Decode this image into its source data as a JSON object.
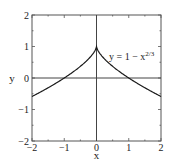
{
  "chart_data": {
    "type": "line",
    "title": "",
    "xlabel": "x",
    "ylabel": "y",
    "xlim": [
      -2,
      2
    ],
    "ylim": [
      -2,
      2
    ],
    "xticks": [
      -2,
      -1,
      0,
      1,
      2
    ],
    "yticks": [
      -2,
      -1,
      0,
      1,
      2
    ],
    "xtick_labels": [
      "−2",
      "−1",
      "0",
      "1",
      "2"
    ],
    "ytick_labels": [
      "−2",
      "−1",
      "0",
      "1",
      "2"
    ],
    "minor_tick_step": 0.5,
    "grid": false,
    "reference_lines": {
      "x": 0,
      "y": 0
    },
    "series": [
      {
        "name": "y = 1 − x^(2/3)",
        "function": "y = 1 - |x|^(2/3)",
        "x": [
          -2,
          -1.75,
          -1.5,
          -1.25,
          -1,
          -0.75,
          -0.5,
          -0.25,
          -0.1,
          0,
          0.1,
          0.25,
          0.5,
          0.75,
          1,
          1.25,
          1.5,
          1.75,
          2
        ],
        "values": [
          -0.587,
          -0.452,
          -0.31,
          -0.16,
          0.0,
          0.175,
          0.37,
          0.603,
          0.785,
          1.0,
          0.785,
          0.603,
          0.37,
          0.175,
          0.0,
          -0.16,
          -0.31,
          -0.452,
          -0.587
        ]
      }
    ],
    "annotations": [
      {
        "text_main": "y = 1 − x",
        "text_sup": "2/3",
        "x": 0.45,
        "y": 0.6
      }
    ]
  },
  "colors": {
    "curve": "#1a1a1a",
    "axes": "#444444",
    "frame": "#555555",
    "background": "#ffffff"
  }
}
